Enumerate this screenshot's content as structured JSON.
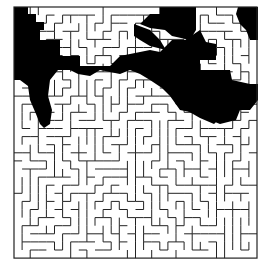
{
  "maze": {
    "cols": 30,
    "rows": 31,
    "x0": 14,
    "y0": 7,
    "cell": 8.1,
    "seed": 7,
    "wall_color": "#222222",
    "fill_color": "#000000",
    "background": "#ffffff"
  },
  "filled_regions": [
    [
      [
        14,
        7
      ],
      [
        28,
        7
      ],
      [
        28,
        14
      ],
      [
        36,
        14
      ],
      [
        36,
        22
      ],
      [
        44,
        22
      ],
      [
        44,
        30
      ],
      [
        40,
        30
      ],
      [
        40,
        40
      ],
      [
        60,
        40
      ],
      [
        60,
        56
      ],
      [
        80,
        56
      ],
      [
        80,
        66
      ],
      [
        110,
        66
      ],
      [
        120,
        56
      ],
      [
        150,
        50
      ],
      [
        160,
        52
      ],
      [
        172,
        40
      ],
      [
        185,
        40
      ],
      [
        200,
        30
      ],
      [
        206,
        42
      ],
      [
        216,
        44
      ],
      [
        216,
        60
      ],
      [
        200,
        60
      ],
      [
        200,
        70
      ],
      [
        230,
        70
      ],
      [
        232,
        80
      ],
      [
        250,
        84
      ],
      [
        258,
        84
      ],
      [
        258,
        100
      ],
      [
        250,
        110
      ],
      [
        240,
        110
      ],
      [
        236,
        120
      ],
      [
        220,
        124
      ],
      [
        210,
        120
      ],
      [
        200,
        110
      ],
      [
        190,
        112
      ],
      [
        180,
        110
      ],
      [
        170,
        96
      ],
      [
        162,
        88
      ],
      [
        150,
        80
      ],
      [
        140,
        74
      ],
      [
        130,
        70
      ],
      [
        120,
        74
      ],
      [
        110,
        72
      ],
      [
        100,
        70
      ],
      [
        90,
        76
      ],
      [
        78,
        74
      ],
      [
        70,
        70
      ],
      [
        58,
        70
      ],
      [
        50,
        80
      ],
      [
        48,
        96
      ],
      [
        52,
        110
      ],
      [
        50,
        124
      ],
      [
        44,
        128
      ],
      [
        40,
        124
      ],
      [
        36,
        114
      ],
      [
        30,
        100
      ],
      [
        28,
        86
      ],
      [
        20,
        80
      ],
      [
        14,
        80
      ]
    ],
    [
      [
        160,
        7
      ],
      [
        196,
        7
      ],
      [
        196,
        30
      ],
      [
        190,
        40
      ],
      [
        172,
        36
      ],
      [
        165,
        30
      ],
      [
        150,
        28
      ],
      [
        140,
        24
      ],
      [
        150,
        14
      ],
      [
        160,
        14
      ]
    ],
    [
      [
        238,
        7
      ],
      [
        258,
        7
      ],
      [
        258,
        40
      ],
      [
        250,
        40
      ],
      [
        246,
        30
      ],
      [
        240,
        24
      ],
      [
        236,
        14
      ]
    ],
    [
      [
        134,
        24
      ],
      [
        150,
        30
      ],
      [
        160,
        40
      ],
      [
        166,
        50
      ],
      [
        150,
        46
      ],
      [
        140,
        40
      ],
      [
        134,
        36
      ]
    ],
    [
      [
        146,
        60
      ],
      [
        160,
        60
      ],
      [
        176,
        70
      ],
      [
        186,
        86
      ],
      [
        196,
        100
      ],
      [
        210,
        110
      ],
      [
        220,
        118
      ],
      [
        214,
        124
      ],
      [
        200,
        118
      ],
      [
        186,
        110
      ],
      [
        176,
        100
      ],
      [
        166,
        90
      ],
      [
        156,
        80
      ],
      [
        150,
        70
      ]
    ]
  ]
}
